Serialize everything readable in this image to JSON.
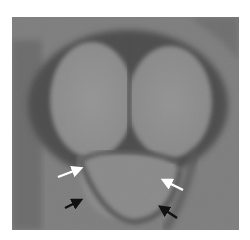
{
  "image": {
    "description": "Grayscale MRI-like cross-sectional image showing two rounded lobes above and a lower crescent structure, with white and black arrows marking the lower boundary",
    "colors": {
      "background_margin": "#ffffff",
      "tissue_mid": "#8a8a8a",
      "tissue_light": "#9a9a9a",
      "boundary_dark": "#3c3c3c",
      "white_arrow": "#ffffff",
      "black_arrow": "#111111"
    }
  },
  "annotations": {
    "arrows": [
      {
        "id": "white-arrow-left",
        "color": "white",
        "from": [
          58,
          177
        ],
        "to": [
          83,
          168
        ]
      },
      {
        "id": "white-arrow-right",
        "color": "white",
        "from": [
          183,
          190
        ],
        "to": [
          161,
          179
        ]
      },
      {
        "id": "black-arrow-left",
        "color": "black",
        "from": [
          65,
          208
        ],
        "to": [
          83,
          199
        ]
      },
      {
        "id": "black-arrow-right",
        "color": "black",
        "from": [
          177,
          218
        ],
        "to": [
          159,
          205
        ]
      }
    ]
  }
}
